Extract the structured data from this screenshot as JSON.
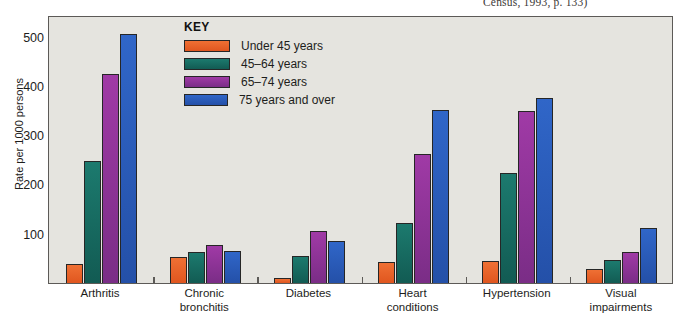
{
  "source_caption": "Census, 1993, p. 133)",
  "legend": {
    "title": "KEY",
    "entries": [
      {
        "label": "Under 45 years",
        "color": "#e8622c"
      },
      {
        "label": "45–64 years",
        "color": "#1a6b63"
      },
      {
        "label": "65–74 years",
        "color": "#8e3592"
      },
      {
        "label": "75 years and over",
        "color": "#2b5fbf"
      }
    ]
  },
  "chart_data": {
    "type": "bar",
    "title": "",
    "xlabel": "",
    "ylabel": "Rate per 1000 persons",
    "ylim": [
      0,
      540
    ],
    "yticks": [
      100,
      200,
      300,
      400,
      500
    ],
    "ytick_labels": [
      "100",
      "200",
      "300",
      "400",
      "500"
    ],
    "grid": false,
    "legend_position": "inside-top-left",
    "categories": [
      "Arthritis",
      "Chronic\nbronchitis",
      "Diabetes",
      "Heart\nconditions",
      "Hypertension",
      "Visual\nimpairments"
    ],
    "series": [
      {
        "name": "Under 45 years",
        "color": "#e8622c",
        "values": [
          38,
          52,
          11,
          42,
          45,
          28
        ]
      },
      {
        "name": "45–64 years",
        "color": "#1a6b63",
        "values": [
          247,
          62,
          55,
          122,
          223,
          46
        ]
      },
      {
        "name": "65–74 years",
        "color": "#8e3592",
        "values": [
          424,
          77,
          105,
          262,
          350,
          63
        ]
      },
      {
        "name": "75 years and over",
        "color": "#2b5fbf",
        "values": [
          505,
          65,
          85,
          352,
          376,
          111
        ]
      }
    ]
  }
}
